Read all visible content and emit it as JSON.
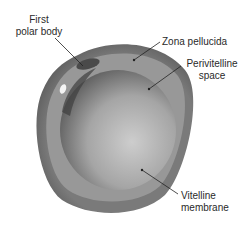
{
  "diagram": {
    "labels": {
      "first_polar_body": [
        "First",
        "polar body"
      ],
      "zona_pellucida": "Zona pellucida",
      "perivitelline_space": [
        "Perivitelline",
        "space"
      ],
      "vitelline_membrane": [
        "Vitelline",
        "membrane"
      ]
    },
    "colors": {
      "zona_pellucida": "#6f6f6f",
      "perivitelline_space": "#9a9a9a",
      "oocyte_light": "#c8c8c8",
      "oocyte_dark": "#5a5a5a",
      "leader_line": "#222222",
      "text": "#2a2a2a"
    }
  }
}
